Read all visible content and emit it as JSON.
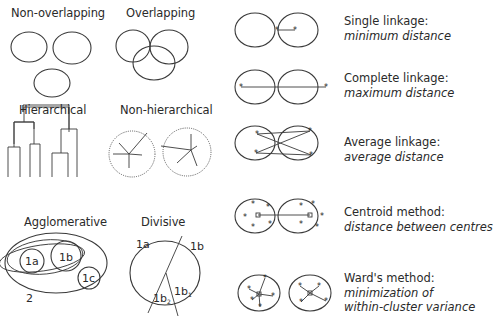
{
  "left_panels": {
    "non_overlapping": {
      "title": "Non-overlapping"
    },
    "overlapping": {
      "title": "Overlapping"
    },
    "hierarchical": {
      "title": "Hierarchical"
    },
    "non_hierarchical": {
      "title": "Non-hierarchical"
    },
    "agglomerative": {
      "title": "Agglomerative",
      "labels": {
        "a": "1a",
        "b": "1b",
        "c": "1c",
        "outer": "2"
      }
    },
    "divisive": {
      "title": "Divisive",
      "labels": {
        "a": "1a",
        "b": "1b",
        "b1": "1b",
        "b1_sub": "1",
        "b2": "1b",
        "b2_sub": "2"
      }
    }
  },
  "linkage_methods": [
    {
      "name": "Single linkage:",
      "description": "minimum distance"
    },
    {
      "name": "Complete linkage:",
      "description": "maximum distance"
    },
    {
      "name": "Average linkage:",
      "description": "average distance"
    },
    {
      "name": "Centroid method:",
      "description": "distance between centres"
    },
    {
      "name": "Ward's method:",
      "description": "minimization of within-cluster variance",
      "description_lines": [
        "minimization of",
        "within-cluster variance"
      ]
    }
  ],
  "icons": {
    "point_marker": "*",
    "centroid_marker": "square"
  },
  "colors": {
    "line": "#3a3a3a",
    "text": "#2a2a2a",
    "background": "#ffffff"
  }
}
